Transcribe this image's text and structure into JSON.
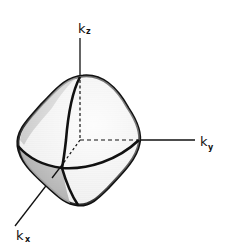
{
  "figure": {
    "axes": [
      {
        "id": "kz",
        "base": "k",
        "subscript": "z"
      },
      {
        "id": "ky",
        "base": "k",
        "subscript": "y"
      },
      {
        "id": "kx",
        "base": "k",
        "subscript": "x"
      }
    ],
    "colors": {
      "ink": "#111111",
      "background": "#ffffff",
      "shade_light": "#e6e6e6",
      "shade_dark": "#9a9a9a"
    }
  }
}
